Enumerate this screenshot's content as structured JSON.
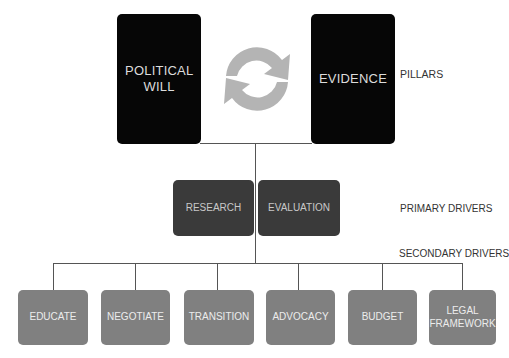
{
  "pillars": {
    "label": "PILLARS",
    "items": [
      {
        "name": "political-will",
        "label": "POLITICAL WILL"
      },
      {
        "name": "evidence",
        "label": "EVIDENCE"
      }
    ],
    "cycle_icon": "refresh-cycle-arrows"
  },
  "primary_drivers": {
    "label": "PRIMARY DRIVERS",
    "items": [
      {
        "name": "research",
        "label": "RESEARCH"
      },
      {
        "name": "evaluation",
        "label": "EVALUATION"
      }
    ]
  },
  "secondary_drivers": {
    "label": "SECONDARY DRIVERS",
    "items": [
      {
        "name": "educate",
        "label": "EDUCATE"
      },
      {
        "name": "negotiate",
        "label": "NEGOTIATE"
      },
      {
        "name": "transition",
        "label": "TRANSITION"
      },
      {
        "name": "advocacy",
        "label": "ADVOCACY"
      },
      {
        "name": "budget",
        "label": "BUDGET"
      },
      {
        "name": "legal-framework",
        "label": "LEGAL FRAMEWORK"
      }
    ]
  },
  "colors": {
    "pillar": "#060606",
    "primary": "#3a3a3a",
    "secondary": "#808080",
    "cycle_arrows": "#b4b4b4",
    "connector": "#555555"
  }
}
